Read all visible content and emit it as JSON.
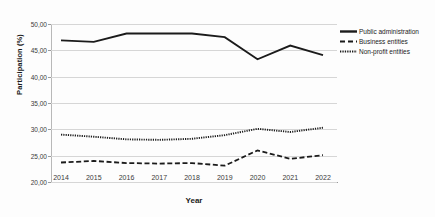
{
  "chart_data": {
    "type": "line",
    "title": "",
    "xlabel": "Year",
    "ylabel": "Participation (%)",
    "categories": [
      "2014",
      "2015",
      "2016",
      "2017",
      "2018",
      "2019",
      "2020",
      "2021",
      "2022"
    ],
    "x": [
      2014,
      2015,
      2016,
      2017,
      2018,
      2019,
      2020,
      2021,
      2022
    ],
    "ylim": [
      20.0,
      50.0
    ],
    "yticks": [
      "20,00",
      "25,00",
      "30,00",
      "35,00",
      "40,00",
      "45,00",
      "50,00"
    ],
    "ytick_values": [
      20.0,
      25.0,
      30.0,
      35.0,
      40.0,
      45.0,
      50.0
    ],
    "grid": true,
    "legend_position": "right",
    "series": [
      {
        "name": "Public administration",
        "style": "solid",
        "color": "#1b1b1b",
        "values": [
          46.9,
          46.6,
          48.2,
          48.2,
          48.2,
          47.5,
          43.3,
          45.9,
          44.1
        ]
      },
      {
        "name": "Business entities",
        "style": "dashed",
        "color": "#1b1b1b",
        "values": [
          23.7,
          24.0,
          23.6,
          23.5,
          23.6,
          23.1,
          26.0,
          24.4,
          25.1
        ]
      },
      {
        "name": "Non-profit entities",
        "style": "dotted",
        "color": "#1b1b1b",
        "values": [
          29.0,
          28.6,
          28.1,
          28.0,
          28.2,
          28.9,
          30.1,
          29.5,
          30.3
        ]
      }
    ]
  },
  "legend": {
    "items": [
      {
        "label": "Public administration",
        "style": "solid"
      },
      {
        "label": "Business entities",
        "style": "dashed"
      },
      {
        "label": "Non-profit entities",
        "style": "dotted"
      }
    ]
  }
}
